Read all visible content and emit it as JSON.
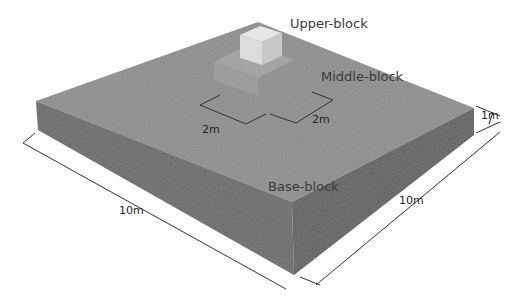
{
  "diagram": {
    "type": "3d-block-foundation-illustration",
    "labels": {
      "upper_block": "Upper-block",
      "middle_block": "Middle-block",
      "base_block": "Base-block"
    },
    "dimensions": {
      "middle_width_1": "2m",
      "middle_width_2": "2m",
      "base_height": "1m",
      "base_length_left": "10m",
      "base_length_right": "10m"
    },
    "colors": {
      "background": "#ffffff",
      "base_top": "#8e8e8e",
      "base_front_left": "#6b6b6b",
      "base_front_right": "#616161",
      "middle_top": "#a9a9a9",
      "upper_top": "#e2e2e2",
      "upper_front_left": "#d6d6d6",
      "upper_front_right": "#c4c4c4",
      "dimension_line": "#333333"
    }
  }
}
